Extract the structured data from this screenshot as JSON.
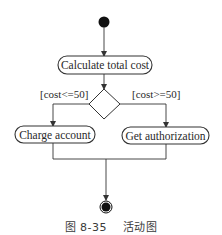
{
  "diagram": {
    "type": "UML activity diagram",
    "initial_node": {
      "label": ""
    },
    "actions": [
      {
        "id": "calc",
        "label": "Calculate total cost"
      },
      {
        "id": "charge",
        "label": "Charge account"
      },
      {
        "id": "auth",
        "label": "Get authorization"
      }
    ],
    "decision": {
      "guards": [
        {
          "branch": "left",
          "label": "[cost<=50]"
        },
        {
          "branch": "right",
          "label": "[cost>=50]"
        }
      ]
    },
    "final_node": {
      "label": ""
    },
    "edges": [
      {
        "from": "initial",
        "to": "calc"
      },
      {
        "from": "calc",
        "to": "decision"
      },
      {
        "from": "decision",
        "to": "charge",
        "guard": "[cost<=50]"
      },
      {
        "from": "decision",
        "to": "auth",
        "guard": "[cost>=50]"
      },
      {
        "from": "charge",
        "to": "final"
      },
      {
        "from": "auth",
        "to": "final"
      }
    ],
    "colors": {
      "stroke": "#333333",
      "fill": "#ffffff",
      "node": "#111111"
    }
  },
  "caption": {
    "figure_number": "图 8-35",
    "title": "活动图",
    "full": "图 8-35    活动图"
  }
}
